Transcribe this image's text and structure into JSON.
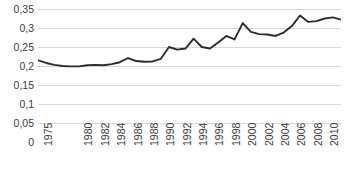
{
  "chart_data": {
    "type": "line",
    "title": "",
    "subtitle": "",
    "xlabel": "",
    "ylabel": "",
    "grid": true,
    "legend": false,
    "legend_position": "none",
    "line_color": "#2b2b2b",
    "gridline_color": "#d9d9d9",
    "text_color": "#3b3b3b",
    "background_color": "#ffffff",
    "decimal_separator": ",",
    "ylim": [
      0,
      0.35
    ],
    "xlim": [
      1975,
      2012
    ],
    "y_ticks": [
      0,
      0.05,
      0.1,
      0.15,
      0.2,
      0.25,
      0.3,
      0.35
    ],
    "y_tick_labels": [
      "0",
      "0,05",
      "0,1",
      "0,15",
      "0,2",
      "0,25",
      "0,3",
      "0,35"
    ],
    "x_tick_labels": [
      "1975",
      "1980",
      "1982",
      "1984",
      "1986",
      "1988",
      "1990",
      "1992",
      "1994",
      "1996",
      "1998",
      "2000",
      "2002",
      "2004",
      "2006",
      "2008",
      "2010",
      "2012"
    ],
    "x_tick_values": [
      1975,
      1980,
      1982,
      1984,
      1986,
      1988,
      1990,
      1992,
      1994,
      1996,
      1998,
      2000,
      2002,
      2004,
      2006,
      2008,
      2010,
      2012
    ],
    "x": [
      1975,
      1976,
      1977,
      1978,
      1979,
      1980,
      1981,
      1982,
      1983,
      1984,
      1985,
      1986,
      1987,
      1988,
      1989,
      1990,
      1991,
      1992,
      1993,
      1994,
      1995,
      1996,
      1997,
      1998,
      1999,
      2000,
      2001,
      2002,
      2003,
      2004,
      2005,
      2006,
      2007,
      2008,
      2009,
      2010,
      2011,
      2012
    ],
    "values": [
      0.215,
      0.208,
      0.203,
      0.2,
      0.199,
      0.199,
      0.202,
      0.203,
      0.202,
      0.205,
      0.21,
      0.221,
      0.213,
      0.211,
      0.212,
      0.219,
      0.25,
      0.243,
      0.246,
      0.272,
      0.25,
      0.246,
      0.262,
      0.279,
      0.27,
      0.313,
      0.29,
      0.284,
      0.283,
      0.279,
      0.288,
      0.305,
      0.333,
      0.316,
      0.318,
      0.325,
      0.328,
      0.322
    ],
    "series": [
      {
        "name": "series-1",
        "values": [
          0.215,
          0.208,
          0.203,
          0.2,
          0.199,
          0.199,
          0.202,
          0.203,
          0.202,
          0.205,
          0.21,
          0.221,
          0.213,
          0.211,
          0.212,
          0.219,
          0.25,
          0.243,
          0.246,
          0.272,
          0.25,
          0.246,
          0.262,
          0.279,
          0.27,
          0.313,
          0.29,
          0.284,
          0.283,
          0.279,
          0.288,
          0.305,
          0.333,
          0.316,
          0.318,
          0.325,
          0.328,
          0.322
        ]
      }
    ]
  }
}
